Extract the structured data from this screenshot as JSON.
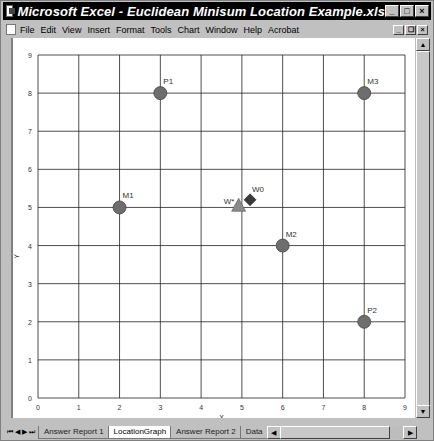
{
  "window": {
    "title": "Microsoft Excel - Euclidean Minisum Location Example.xls",
    "controls": {
      "minimize": "_",
      "maximize": "□",
      "close": "×"
    }
  },
  "menubar": {
    "items": [
      {
        "label": "File",
        "accel": "F"
      },
      {
        "label": "Edit",
        "accel": "E"
      },
      {
        "label": "View",
        "accel": "V"
      },
      {
        "label": "Insert",
        "accel": "I"
      },
      {
        "label": "Format",
        "accel": "o"
      },
      {
        "label": "Tools",
        "accel": "T"
      },
      {
        "label": "Chart",
        "accel": "C"
      },
      {
        "label": "Window",
        "accel": "W"
      },
      {
        "label": "Help",
        "accel": "H"
      },
      {
        "label": "Acrobat",
        "accel": "b"
      }
    ],
    "doc_controls": {
      "minimize": "_",
      "restore": "❐",
      "close": "×"
    }
  },
  "sheet_tabs": {
    "nav": [
      "⏮",
      "◀",
      "▶",
      "⏭"
    ],
    "tabs": [
      {
        "label": "Answer Report 1",
        "active": false
      },
      {
        "label": "LocationGraph",
        "active": true
      },
      {
        "label": "Answer Report 2",
        "active": false
      },
      {
        "label": "Data",
        "active": false
      }
    ]
  },
  "chart_data": {
    "type": "scatter",
    "title": "",
    "xlabel": "X",
    "ylabel": "Y",
    "xlim": [
      0,
      9
    ],
    "ylim": [
      0,
      9
    ],
    "x_ticks": [
      "0",
      "1",
      "2",
      "3",
      "4",
      "5",
      "6",
      "7",
      "8",
      "9"
    ],
    "y_ticks": [
      "0",
      "1",
      "2",
      "3",
      "4",
      "5",
      "6",
      "7",
      "8",
      "9"
    ],
    "grid": true,
    "legend": "none",
    "series": [
      {
        "name": "Facilities",
        "marker": "circle",
        "color": "#6e6e6e",
        "points": [
          {
            "label": "P1",
            "x": 3,
            "y": 8
          },
          {
            "label": "M3",
            "x": 8,
            "y": 8
          },
          {
            "label": "M1",
            "x": 2,
            "y": 5
          },
          {
            "label": "M2",
            "x": 6,
            "y": 4
          },
          {
            "label": "P2",
            "x": 8,
            "y": 2
          }
        ]
      },
      {
        "name": "Optimal",
        "marker": "triangle",
        "color": "#8a8a8a",
        "points": [
          {
            "label": "W*",
            "x": 4.92,
            "y": 5.03
          }
        ]
      },
      {
        "name": "Initial",
        "marker": "diamond",
        "color": "#3a3a3a",
        "points": [
          {
            "label": "W0",
            "x": 5.2,
            "y": 5.2
          }
        ]
      }
    ]
  }
}
